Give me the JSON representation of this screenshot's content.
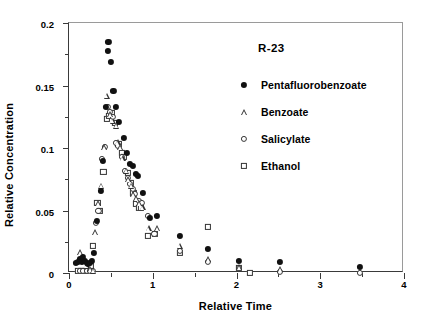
{
  "chart_data": {
    "type": "scatter",
    "title": "",
    "annotation": "R-23",
    "xlabel": "Relative Time",
    "ylabel": "Relative Concentration",
    "xlim": [
      0,
      4
    ],
    "ylim": [
      0,
      0.2
    ],
    "xticks": [
      0,
      1,
      2,
      3,
      4
    ],
    "xticklabels": [
      "0",
      "1",
      "2",
      "3",
      "4"
    ],
    "xticks_minor": [
      0.5,
      1.5,
      2.5,
      3.5
    ],
    "yticks": [
      0,
      0.05,
      0.1,
      0.15,
      0.2
    ],
    "yticklabels": [
      "0",
      "0.05",
      "0.1",
      "0.15",
      "0.2"
    ],
    "yticks_minor": [
      0.025,
      0.075,
      0.125,
      0.175
    ],
    "grid": false,
    "legend_position": "upper-right-inside",
    "series": [
      {
        "name": "Pentafluorobenzoate",
        "marker": "filled-circle",
        "color": "#111111",
        "points": [
          [
            0.08,
            0.008
          ],
          [
            0.11,
            0.009
          ],
          [
            0.13,
            0.011
          ],
          [
            0.15,
            0.009
          ],
          [
            0.17,
            0.013
          ],
          [
            0.19,
            0.01
          ],
          [
            0.21,
            0.008
          ],
          [
            0.23,
            0.007
          ],
          [
            0.25,
            0.008
          ],
          [
            0.27,
            0.01
          ],
          [
            0.3,
            0.016
          ],
          [
            0.33,
            0.042
          ],
          [
            0.38,
            0.066
          ],
          [
            0.4,
            0.09
          ],
          [
            0.44,
            0.133
          ],
          [
            0.46,
            0.178
          ],
          [
            0.47,
            0.185
          ],
          [
            0.5,
            0.169
          ],
          [
            0.53,
            0.146
          ],
          [
            0.56,
            0.133
          ],
          [
            0.6,
            0.121
          ],
          [
            0.66,
            0.108
          ],
          [
            0.69,
            0.096
          ],
          [
            0.73,
            0.087
          ],
          [
            0.76,
            0.086
          ],
          [
            0.8,
            0.079
          ],
          [
            0.82,
            0.078
          ],
          [
            0.88,
            0.064
          ],
          [
            0.97,
            0.044
          ],
          [
            1.05,
            0.046
          ],
          [
            1.32,
            0.03
          ],
          [
            1.66,
            0.019
          ],
          [
            2.03,
            0.01
          ],
          [
            2.52,
            0.009
          ],
          [
            3.47,
            0.005
          ]
        ]
      },
      {
        "name": "Benzoate",
        "marker": "open-triangle",
        "color": "#333333",
        "points": [
          [
            0.13,
            0.017
          ],
          [
            0.17,
            0.013
          ],
          [
            0.21,
            0.006
          ],
          [
            0.25,
            0.003
          ],
          [
            0.29,
            0.002
          ],
          [
            0.31,
            0.033
          ],
          [
            0.35,
            0.056
          ],
          [
            0.38,
            0.07
          ],
          [
            0.42,
            0.101
          ],
          [
            0.45,
            0.142
          ],
          [
            0.49,
            0.127
          ],
          [
            0.52,
            0.122
          ],
          [
            0.56,
            0.118
          ],
          [
            0.58,
            0.105
          ],
          [
            0.61,
            0.101
          ],
          [
            0.64,
            0.092
          ],
          [
            0.68,
            0.082
          ],
          [
            0.71,
            0.075
          ],
          [
            0.74,
            0.07
          ],
          [
            0.77,
            0.063
          ],
          [
            0.8,
            0.06
          ],
          [
            0.84,
            0.056
          ],
          [
            0.88,
            0.053
          ],
          [
            0.95,
            0.036
          ],
          [
            1.05,
            0.036
          ],
          [
            1.32,
            0.022
          ],
          [
            1.66,
            0.011
          ],
          [
            2.03,
            0.005
          ],
          [
            2.52,
            0.003
          ]
        ]
      },
      {
        "name": "Salicylate",
        "marker": "open-circle",
        "color": "#333333",
        "points": [
          [
            0.13,
            0.002
          ],
          [
            0.17,
            0.002
          ],
          [
            0.21,
            0.002
          ],
          [
            0.25,
            0.002
          ],
          [
            0.29,
            0.002
          ],
          [
            0.32,
            0.04
          ],
          [
            0.35,
            0.05
          ],
          [
            0.39,
            0.091
          ],
          [
            0.43,
            0.101
          ],
          [
            0.46,
            0.133
          ],
          [
            0.49,
            0.129
          ],
          [
            0.52,
            0.125
          ],
          [
            0.56,
            0.104
          ],
          [
            0.59,
            0.102
          ],
          [
            0.63,
            0.093
          ],
          [
            0.67,
            0.082
          ],
          [
            0.7,
            0.076
          ],
          [
            0.73,
            0.071
          ],
          [
            0.76,
            0.067
          ],
          [
            0.79,
            0.063
          ],
          [
            0.83,
            0.058
          ],
          [
            0.87,
            0.056
          ],
          [
            0.94,
            0.046
          ],
          [
            1.02,
            0.031
          ],
          [
            1.32,
            0.018
          ],
          [
            1.66,
            0.009
          ],
          [
            2.03,
            0.004
          ],
          [
            2.52,
            0.001
          ],
          [
            3.47,
            0.0
          ]
        ]
      },
      {
        "name": "Ethanol",
        "marker": "open-square",
        "color": "#333333",
        "points": [
          [
            0.11,
            0.002
          ],
          [
            0.14,
            0.002
          ],
          [
            0.17,
            0.002
          ],
          [
            0.2,
            0.002
          ],
          [
            0.23,
            0.003
          ],
          [
            0.26,
            0.006
          ],
          [
            0.29,
            0.022
          ],
          [
            0.34,
            0.056
          ],
          [
            0.37,
            0.05
          ],
          [
            0.41,
            0.081
          ],
          [
            0.45,
            0.123
          ],
          [
            0.48,
            0.126
          ],
          [
            0.51,
            0.128
          ],
          [
            0.55,
            0.12
          ],
          [
            0.59,
            0.103
          ],
          [
            0.63,
            0.096
          ],
          [
            0.66,
            0.093
          ],
          [
            0.7,
            0.08
          ],
          [
            0.74,
            0.072
          ],
          [
            0.77,
            0.064
          ],
          [
            0.8,
            0.055
          ],
          [
            0.83,
            0.052
          ],
          [
            0.86,
            0.052
          ],
          [
            0.94,
            0.03
          ],
          [
            1.03,
            0.031
          ],
          [
            1.32,
            0.016
          ],
          [
            1.66,
            0.037
          ],
          [
            2.03,
            0.004
          ],
          [
            2.16,
            0.0
          ]
        ]
      }
    ]
  },
  "legend": {
    "title": "R-23",
    "entries": [
      {
        "label": "Pentafluorobenzoate",
        "marker": "filled-circle"
      },
      {
        "label": "Benzoate",
        "marker": "open-triangle"
      },
      {
        "label": "Salicylate",
        "marker": "open-circle"
      },
      {
        "label": "Ethanol",
        "marker": "open-square"
      }
    ]
  },
  "axes": {
    "x_title": "Relative Time",
    "y_title": "Relative Concentration"
  }
}
